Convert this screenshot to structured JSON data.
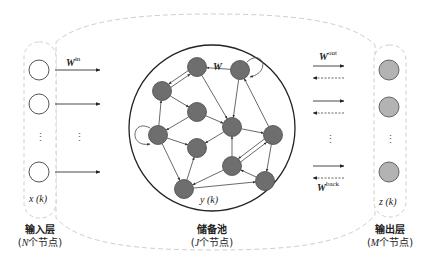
{
  "diagram": {
    "input_layer": {
      "label": "输入层",
      "count_prefix": "(",
      "count_var": "N",
      "count_suffix": "个节点)",
      "vector": "x (k)",
      "visible_nodes": 3,
      "node_fill": "#ffffff"
    },
    "reservoir": {
      "label": "储备池",
      "count_prefix": "(",
      "count_var": "J",
      "count_suffix": "个节点)",
      "vector": "y (k)",
      "weight": "W",
      "node_fill": "#6e6e6e",
      "nodes": [
        {
          "id": "n1",
          "x": 197,
          "y": 67
        },
        {
          "id": "n2",
          "x": 240,
          "y": 70,
          "self_loop": true
        },
        {
          "id": "n3",
          "x": 162,
          "y": 91
        },
        {
          "id": "n4",
          "x": 197,
          "y": 112
        },
        {
          "id": "n5",
          "x": 158,
          "y": 135,
          "self_loop": true
        },
        {
          "id": "n6",
          "x": 232,
          "y": 127
        },
        {
          "id": "n7",
          "x": 197,
          "y": 148
        },
        {
          "id": "n8",
          "x": 273,
          "y": 135
        },
        {
          "id": "n9",
          "x": 232,
          "y": 166
        },
        {
          "id": "n10",
          "x": 265,
          "y": 181
        },
        {
          "id": "n11",
          "x": 184,
          "y": 189
        }
      ],
      "edges": [
        [
          "n2",
          "n1"
        ],
        [
          "n3",
          "n1"
        ],
        [
          "n1",
          "n3"
        ],
        [
          "n1",
          "n6"
        ],
        [
          "n2",
          "n6"
        ],
        [
          "n3",
          "n4"
        ],
        [
          "n4",
          "n5"
        ],
        [
          "n5",
          "n3"
        ],
        [
          "n4",
          "n6"
        ],
        [
          "n6",
          "n7"
        ],
        [
          "n5",
          "n7"
        ],
        [
          "n5",
          "n11"
        ],
        [
          "n6",
          "n8"
        ],
        [
          "n8",
          "n2"
        ],
        [
          "n9",
          "n6"
        ],
        [
          "n8",
          "n9"
        ],
        [
          "n9",
          "n8"
        ],
        [
          "n8",
          "n10"
        ],
        [
          "n10",
          "n9"
        ],
        [
          "n9",
          "n11"
        ],
        [
          "n11",
          "n7"
        ],
        [
          "n11",
          "n10"
        ]
      ]
    },
    "output_layer": {
      "label": "输出层",
      "count_prefix": "(",
      "count_var": "M",
      "count_suffix": "个节点)",
      "vector": "z (k)",
      "visible_nodes": 3,
      "node_fill": "#b3b3b3"
    },
    "weights": {
      "input": {
        "base": "W",
        "sup": "in"
      },
      "output": {
        "base": "W",
        "sup": "out"
      },
      "feedback": {
        "base": "W",
        "sup": "back"
      }
    },
    "ellipsis": "⋮"
  }
}
